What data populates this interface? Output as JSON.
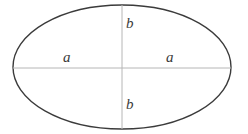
{
  "figure": {
    "type": "geometry-diagram",
    "shape": "ellipse",
    "background_color": "#ffffff",
    "width": 248,
    "height": 134
  },
  "ellipse": {
    "name": "ellipse-outline",
    "center_x": 122,
    "center_y": 67,
    "semi_major_axis_px": 109,
    "semi_minor_axis_px": 62,
    "stroke_color": "#3b3b3b",
    "stroke_width": 1.4,
    "fill": "none"
  },
  "axes": {
    "horizontal": {
      "name": "major-axis-line",
      "x1": 13,
      "y1": 68,
      "x2": 231,
      "y2": 68,
      "stroke_color": "#b6b6b6",
      "stroke_width": 1
    },
    "vertical": {
      "name": "minor-axis-line",
      "x1": 122,
      "y1": 5,
      "x2": 122,
      "y2": 129,
      "stroke_color": "#b6b6b6",
      "stroke_width": 1
    }
  },
  "labels": {
    "a_left": "a",
    "a_right": "a",
    "b_top": "b",
    "b_bottom": "b"
  }
}
